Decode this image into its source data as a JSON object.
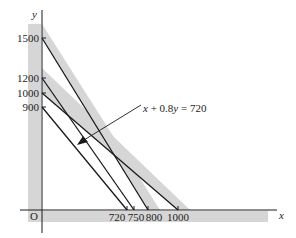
{
  "diagram": {
    "type": "linear-programming-constraint-graph",
    "axes": {
      "x_label": "x",
      "y_label": "y",
      "origin_label": "O"
    },
    "y_ticks": [
      {
        "value": 1500,
        "label": "1500"
      },
      {
        "value": 1200,
        "label": "1200"
      },
      {
        "value": 1000,
        "label": "1000"
      },
      {
        "value": 900,
        "label": "900"
      }
    ],
    "x_ticks": [
      {
        "value": 720,
        "label": "720"
      },
      {
        "value": 750,
        "label": "750"
      },
      {
        "value": 800,
        "label": "800"
      },
      {
        "value": 1000,
        "label": "1000"
      }
    ],
    "lines": [
      {
        "id": "line-1500-800",
        "y_intercept": 1500,
        "x_intercept": 800,
        "shaded": true
      },
      {
        "id": "line-1200-750",
        "y_intercept": 1200,
        "x_intercept": 750,
        "shaded": false
      },
      {
        "id": "line-1000-1000",
        "y_intercept": 1000,
        "x_intercept": 1000,
        "shaded": true
      },
      {
        "id": "line-900-720",
        "y_intercept": 900,
        "x_intercept": 720,
        "shaded": false
      }
    ],
    "annotation": {
      "parts": [
        {
          "text": "x",
          "italic": true
        },
        {
          "text": " + 0.8",
          "italic": false
        },
        {
          "text": "y",
          "italic": true
        },
        {
          "text": " = 720",
          "italic": false
        }
      ],
      "points_to": "line-900-720"
    },
    "colors": {
      "shade": "#d6d6d6",
      "line": "#1a1a1a",
      "background": "#ffffff"
    }
  }
}
